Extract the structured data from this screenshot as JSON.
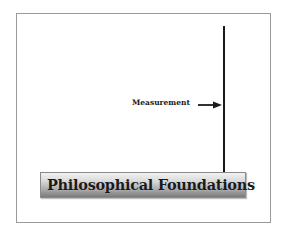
{
  "diagram": {
    "pointer_label": "Measurement",
    "banner_title": "Philosophical Foundations",
    "colors": {
      "line": "#1a1a1a",
      "frame_border": "#9a9a9a",
      "banner_light": "#f2f2f2",
      "banner_dark": "#7a7a7a"
    }
  }
}
